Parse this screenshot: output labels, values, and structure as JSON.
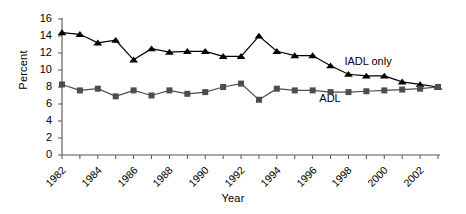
{
  "chart_data": {
    "type": "line",
    "title": "",
    "xlabel": "Year",
    "ylabel": "Percent",
    "xlim": [
      1982,
      2003
    ],
    "ylim": [
      0,
      16
    ],
    "ytick_step": 2,
    "yticks": [
      "0",
      "2",
      "4",
      "6",
      "8",
      "10",
      "12",
      "14",
      "16"
    ],
    "xticks_all": [
      1982,
      1983,
      1984,
      1985,
      1986,
      1987,
      1988,
      1989,
      1990,
      1991,
      1992,
      1993,
      1994,
      1995,
      1996,
      1997,
      1998,
      1999,
      2000,
      2001,
      2002,
      2003
    ],
    "xtick_labels": [
      "1982",
      "1984",
      "1986",
      "1988",
      "1990",
      "1992",
      "1994",
      "1996",
      "1998",
      "2000",
      "2002"
    ],
    "grid": false,
    "legend_position": "inline-annotation",
    "x": [
      1982,
      1983,
      1984,
      1985,
      1986,
      1987,
      1988,
      1989,
      1990,
      1991,
      1992,
      1993,
      1994,
      1995,
      1996,
      1997,
      1998,
      1999,
      2000,
      2001,
      2002,
      2003
    ],
    "series": [
      {
        "name": "IADL only",
        "marker": "triangle",
        "color": "#000000",
        "values": [
          14.4,
          14.2,
          13.2,
          13.5,
          11.2,
          12.5,
          12.1,
          12.2,
          12.2,
          11.6,
          11.6,
          14.0,
          12.2,
          11.7,
          11.7,
          10.5,
          9.5,
          9.3,
          9.3,
          8.6,
          8.3,
          8.0
        ]
      },
      {
        "name": "ADL",
        "marker": "square",
        "color": "#4d4d4d",
        "values": [
          8.3,
          7.6,
          7.8,
          6.9,
          7.6,
          7.0,
          7.6,
          7.2,
          7.4,
          8.0,
          8.4,
          6.5,
          7.8,
          7.6,
          7.6,
          7.4,
          7.4,
          7.5,
          7.6,
          7.7,
          7.8,
          8.0
        ]
      }
    ],
    "annotations": [
      {
        "text": "IADL only",
        "x": 1999,
        "y": 10.9
      },
      {
        "text": "ADL",
        "x": 1997.6,
        "y": 6.6
      }
    ]
  }
}
